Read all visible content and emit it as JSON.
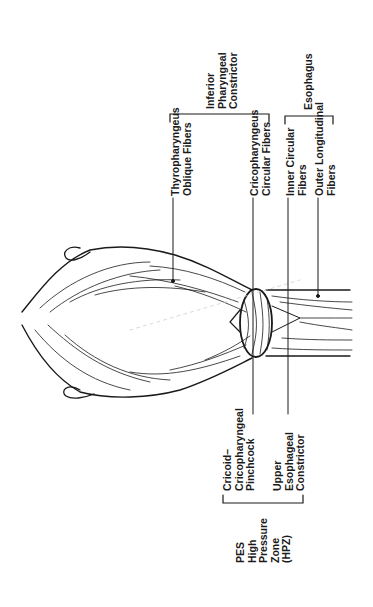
{
  "diagram": {
    "orientation": "rotated -90deg; labels read bottom-to-top",
    "labels": {
      "thyropharyngeus": "Thyropharyngeus\nOblique Fibers",
      "cricopharyngeus": "Cricopharyngeus\nCircular Fibers",
      "inner_circular": "Inner Circular\nFibers",
      "outer_longitudinal": "Outer Longitudinal\nFibers",
      "inferior_constrictor": "Inferior\nPharyngeal\nConstrictor",
      "esophagus": "Esophagus",
      "pinchcock": "Cricoid–\nCricopharyngeal\nPinchcock",
      "upper_esophageal": "Upper\nEsophageal\nConstrictor",
      "pes_hpz": "PES\nHigh\nPressure\nZone\n(HPZ)"
    },
    "groups": [
      {
        "name": "Inferior Pharyngeal Constrictor",
        "members": [
          "Thyropharyngeus Oblique Fibers",
          "Cricopharyngeus Circular Fibers"
        ]
      },
      {
        "name": "Esophagus",
        "members": [
          "Inner Circular Fibers",
          "Outer Longitudinal Fibers"
        ]
      },
      {
        "name": "PES High Pressure Zone (HPZ)",
        "members": [
          "Cricoid–Cricopharyngeal Pinchcock",
          "Upper Esophageal Constrictor"
        ]
      }
    ],
    "colors": {
      "ink": "#1a1a1a",
      "background": "#ffffff"
    }
  }
}
